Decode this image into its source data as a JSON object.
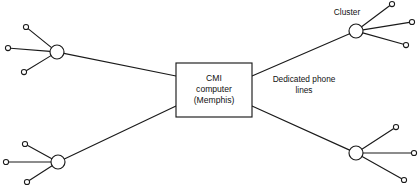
{
  "diagram": {
    "type": "network-topology",
    "width": 420,
    "height": 194,
    "background_color": "#ffffff",
    "line_color": "#1a1a1a",
    "center_node": {
      "label_line_1": "CMI",
      "label_line_2": "computer",
      "label_line_3": "(Memphis)",
      "shape": "rectangle",
      "x": 176,
      "y": 63,
      "width": 76,
      "height": 54
    },
    "annotations": [
      {
        "name": "cluster-label",
        "text": "Cluster",
        "x": 347,
        "y": 13
      },
      {
        "name": "dedicated-phone-lines-label",
        "text_line_1": "Dedicated phone",
        "text_line_2": "lines",
        "x": 304,
        "y": 80
      }
    ],
    "clusters": [
      {
        "name": "cluster-top-left",
        "hub": {
          "x": 57,
          "y": 52,
          "r": 7
        },
        "trunk_from": {
          "x": 176,
          "y": 76
        },
        "terminals": [
          {
            "x": 26,
            "y": 27,
            "r": 2.6
          },
          {
            "x": 8,
            "y": 48,
            "r": 2.6
          },
          {
            "x": 24,
            "y": 72,
            "r": 2.6
          }
        ]
      },
      {
        "name": "cluster-bottom-left",
        "hub": {
          "x": 58,
          "y": 162,
          "r": 7
        },
        "trunk_from": {
          "x": 176,
          "y": 106
        },
        "terminals": [
          {
            "x": 25,
            "y": 144,
            "r": 2.6
          },
          {
            "x": 6,
            "y": 162,
            "r": 2.6
          },
          {
            "x": 27,
            "y": 182,
            "r": 2.6
          }
        ]
      },
      {
        "name": "cluster-top-right",
        "hub": {
          "x": 356,
          "y": 31,
          "r": 7
        },
        "trunk_from": {
          "x": 252,
          "y": 76
        },
        "terminals": [
          {
            "x": 392,
            "y": 4,
            "r": 2.6
          },
          {
            "x": 412,
            "y": 22,
            "r": 2.6
          },
          {
            "x": 406,
            "y": 45,
            "r": 2.6
          }
        ]
      },
      {
        "name": "cluster-bottom-right",
        "hub": {
          "x": 356,
          "y": 153,
          "r": 7
        },
        "trunk_from": {
          "x": 252,
          "y": 106
        },
        "terminals": [
          {
            "x": 396,
            "y": 127,
            "r": 2.6
          },
          {
            "x": 414,
            "y": 153,
            "r": 2.6
          },
          {
            "x": 404,
            "y": 180,
            "r": 2.6
          }
        ]
      }
    ]
  }
}
